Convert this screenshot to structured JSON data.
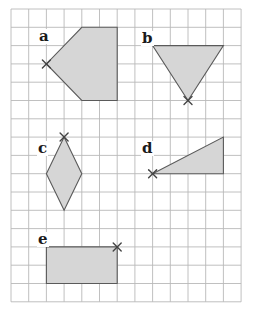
{
  "grid": {
    "origin_x": 11,
    "origin_y": 9,
    "cols": 13,
    "rows": 16,
    "cell_w": 17.7,
    "cell_h": 18.3,
    "line_color": "#b9b9b9"
  },
  "style": {
    "fill_color": "#d6d6d6",
    "outline_color": "#5a5a5a",
    "mark_color": "#444444"
  },
  "shapes": [
    {
      "label": "a",
      "type": "pentagon",
      "vertices": [
        [
          4,
          1
        ],
        [
          6,
          1
        ],
        [
          6,
          5
        ],
        [
          4,
          5
        ],
        [
          2,
          3
        ]
      ],
      "marked_vertex": [
        2,
        3
      ],
      "label_pos": [
        38,
        29
      ]
    },
    {
      "label": "b",
      "type": "triangle",
      "vertices": [
        [
          8,
          2
        ],
        [
          12,
          2
        ],
        [
          10,
          5
        ]
      ],
      "marked_vertex": [
        10,
        5
      ],
      "label_pos": [
        141,
        31
      ]
    },
    {
      "label": "c",
      "type": "rhombus",
      "vertices": [
        [
          3,
          7
        ],
        [
          4,
          9
        ],
        [
          3,
          11
        ],
        [
          2,
          9
        ]
      ],
      "marked_vertex": [
        3,
        7
      ],
      "label_pos": [
        37,
        141
      ]
    },
    {
      "label": "d",
      "type": "right-triangle",
      "vertices": [
        [
          8,
          9
        ],
        [
          12,
          7
        ],
        [
          12,
          9
        ]
      ],
      "marked_vertex": [
        8,
        9
      ],
      "label_pos": [
        141,
        141
      ]
    },
    {
      "label": "e",
      "type": "rectangle",
      "vertices": [
        [
          2,
          13
        ],
        [
          6,
          13
        ],
        [
          6,
          15
        ],
        [
          2,
          15
        ]
      ],
      "marked_vertex": [
        6,
        13
      ],
      "label_pos": [
        37,
        232
      ]
    }
  ]
}
